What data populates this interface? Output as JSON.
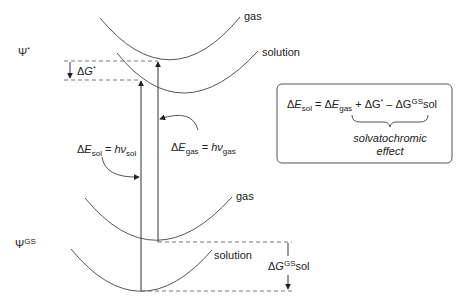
{
  "diagram": {
    "state_labels": {
      "excited": {
        "symbol": "Ψ",
        "sup": "*"
      },
      "ground": {
        "symbol": "Ψ",
        "sup": "GS"
      }
    },
    "curve_labels": {
      "excited_gas": "gas",
      "excited_solution": "solution",
      "ground_gas": "gas",
      "ground_solution": "solution"
    },
    "delta_g_star": {
      "delta": "Δ",
      "var": "G",
      "sup": "*"
    },
    "delta_g_gs_sol": {
      "delta": "Δ",
      "var": "G",
      "sup": "GS",
      "sub": "sol"
    },
    "transition_sol": {
      "lhs_delta": "Δ",
      "lhs_var": "E",
      "lhs_sub": "sol",
      "eq": " = ",
      "rhs_var": "hν",
      "rhs_sub": "sol"
    },
    "transition_gas": {
      "lhs_delta": "Δ",
      "lhs_var": "E",
      "lhs_sub": "gas",
      "eq": " = ",
      "rhs_var": "hν",
      "rhs_sub": "gas"
    },
    "equation_box": {
      "t1_delta": "Δ",
      "t1_var": "E",
      "t1_sub": "sol",
      "eq": " = ",
      "t2_delta": "Δ",
      "t2_var": "E",
      "t2_sub": "gas",
      "t3": " + ΔG",
      "t3_sup": "*",
      "t4": " – ΔG",
      "t4_sup": "GS",
      "t4_tail": "sol",
      "brace_caption_line1": "solvatochromic",
      "brace_caption_line2": "effect"
    }
  }
}
